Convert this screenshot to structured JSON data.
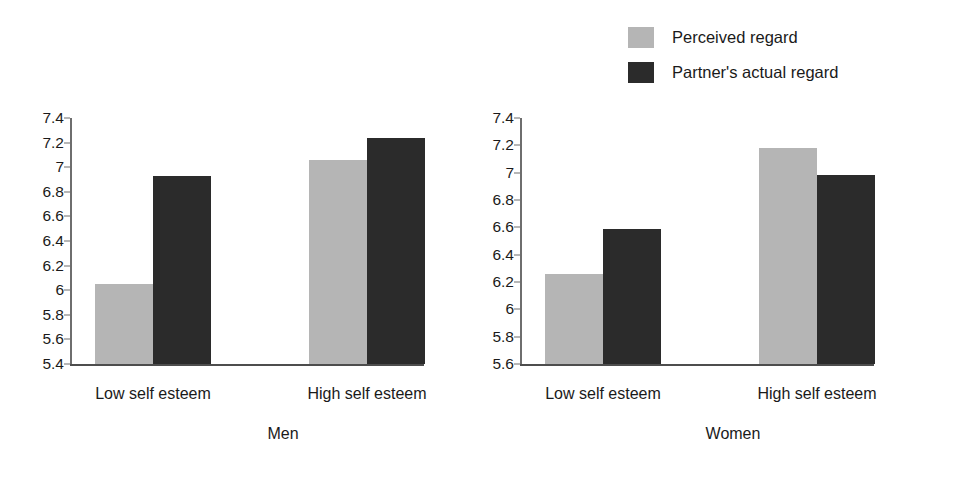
{
  "legend": {
    "items": [
      {
        "label": "Perceived regard",
        "color": "#b5b5b5",
        "swatch_name": "legend-swatch-perceived-regard"
      },
      {
        "label": "Partner's actual regard",
        "color": "#2b2b2b",
        "swatch_name": "legend-swatch-partners-actual-regard"
      }
    ]
  },
  "chart_data": {
    "type": "bar",
    "title": "",
    "xlabel": "",
    "ylabel": "",
    "grid": false,
    "legend_position": "top-right",
    "series_names": [
      "Perceived regard",
      "Partner's actual regard"
    ],
    "series_colors": [
      "#b5b5b5",
      "#2b2b2b"
    ],
    "panels": [
      {
        "name": "Men",
        "categories": [
          "Low self esteem",
          "High self esteem"
        ],
        "ylim": [
          5.4,
          7.4
        ],
        "yticks": [
          7.4,
          7.2,
          7,
          6.8,
          6.6,
          6.4,
          6.2,
          6,
          5.8,
          5.6,
          5.4
        ],
        "ytick_labels": [
          "7.4",
          "7.2",
          "7",
          "6.8",
          "6.6",
          "6.4",
          "6.2",
          "6",
          "5.8",
          "5.6",
          "5.4"
        ],
        "series": [
          {
            "name": "Perceived regard",
            "values": [
              6.05,
              7.06
            ]
          },
          {
            "name": "Partner's actual regard",
            "values": [
              6.93,
              7.24
            ]
          }
        ]
      },
      {
        "name": "Women",
        "categories": [
          "Low self esteem",
          "High self esteem"
        ],
        "ylim": [
          5.6,
          7.4
        ],
        "yticks": [
          7.4,
          7.2,
          7,
          6.8,
          6.6,
          6.4,
          6.2,
          6,
          5.8,
          5.6
        ],
        "ytick_labels": [
          "7.4",
          "7.2",
          "7",
          "6.8",
          "6.6",
          "6.4",
          "6.2",
          "6",
          "5.8",
          "5.6"
        ],
        "series": [
          {
            "name": "Perceived regard",
            "values": [
              6.26,
              7.18
            ]
          },
          {
            "name": "Partner's actual regard",
            "values": [
              6.59,
              6.98
            ]
          }
        ]
      }
    ]
  }
}
